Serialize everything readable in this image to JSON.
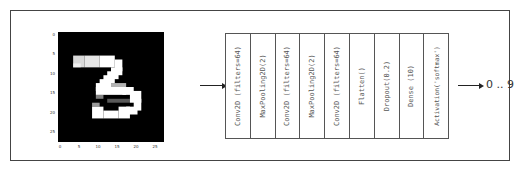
{
  "figure": {
    "input_image": {
      "description": "MNIST handwritten digit",
      "digit": "3",
      "x_ticks": [
        "0",
        "5",
        "10",
        "15",
        "20",
        "25"
      ],
      "y_ticks": [
        "0",
        "5",
        "10",
        "15",
        "20",
        "25"
      ]
    },
    "layers": [
      {
        "label": "Conv2D (filters=64)"
      },
      {
        "label": "MaxPooling2D(2)"
      },
      {
        "label": "Conv2D (filters=64)"
      },
      {
        "label": "MaxPooling2D(2)"
      },
      {
        "label": "Conv2D (filters=64)"
      },
      {
        "label": "Flatten()"
      },
      {
        "label": "Dropout(0.2)"
      },
      {
        "label": "Dense (10)"
      },
      {
        "label": "Activation('softmax')"
      }
    ],
    "output_label": "0 .. 9"
  }
}
